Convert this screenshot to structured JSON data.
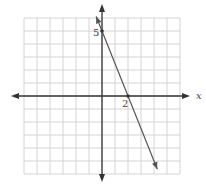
{
  "graph": {
    "x_axis_label": "x",
    "y_axis_label": "y",
    "grid": {
      "x_min": -6,
      "x_max": 6,
      "y_min": -6,
      "y_max": 6,
      "step": 1
    },
    "line": {
      "description": "Line through y-intercept (0, 5) and x-intercept (2, 0)",
      "slope": -2.5,
      "y_intercept": 5,
      "x_intercept": 2,
      "points": [
        [
          0,
          5
        ],
        [
          2,
          0
        ]
      ]
    },
    "annotations": {
      "y_intercept_label": "5",
      "x_intercept_label": "2"
    },
    "colors": {
      "grid": "#d4d4d4",
      "axes": "#333333",
      "line": "#555555"
    }
  }
}
